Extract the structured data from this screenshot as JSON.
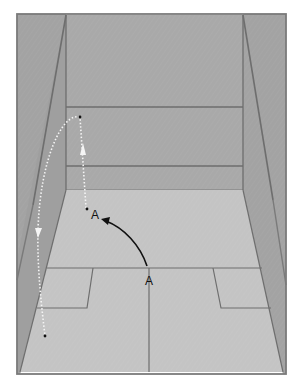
{
  "diagram": {
    "type": "court-perspective",
    "labels": {
      "player_start": "A",
      "player_end": "A"
    },
    "colors": {
      "background": "#ffffff",
      "front_wall": "#a9a9a9",
      "side_wall": "#a3a3a3",
      "side_wall_dark": "#9b9b9b",
      "floor": "#c4c4c4",
      "lines": "#6e6e6e",
      "player_arrow": "#111111",
      "ball_path": "#f5f5f5",
      "ball_point": "#111111"
    },
    "elements": [
      {
        "id": "front-wall",
        "desc": "Front wall with service line and tin line"
      },
      {
        "id": "left-side-wall",
        "desc": "Left side wall in perspective"
      },
      {
        "id": "right-side-wall",
        "desc": "Right side wall in perspective"
      },
      {
        "id": "floor",
        "desc": "Floor with short line, half-court line and service boxes"
      },
      {
        "id": "player-movement-arrow",
        "desc": "Solid black curved arrow from A (T position) to A (front court)"
      },
      {
        "id": "ball-path",
        "desc": "White dotted ball trajectory: up to front wall, then arcing back down the left side"
      }
    ]
  }
}
